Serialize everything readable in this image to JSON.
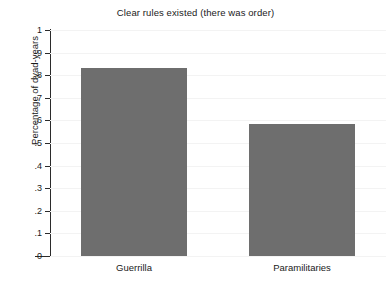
{
  "chart_data": {
    "type": "bar",
    "title": "Clear rules existed (there was order)",
    "xlabel": "",
    "ylabel": "Percentage of dyad-years",
    "categories": [
      "Guerrilla",
      "Paramilitaries"
    ],
    "values": [
      0.83,
      0.585
    ],
    "ylim": [
      0,
      1
    ],
    "yticks": [
      0,
      0.1,
      0.2,
      0.3,
      0.4,
      0.5,
      0.6,
      0.7,
      0.8,
      0.9,
      1
    ],
    "ytick_labels": [
      "0",
      ".1",
      ".2",
      ".3",
      ".4",
      ".5",
      ".6",
      ".7",
      ".8",
      ".9",
      "1"
    ],
    "grid": false,
    "legend": false,
    "bar_color": "#6e6e6e",
    "axis_color": "#2b2b2b",
    "background": "#ffffff"
  }
}
